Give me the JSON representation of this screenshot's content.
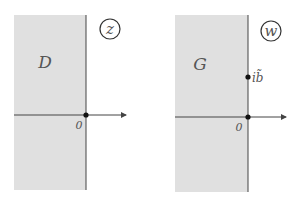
{
  "panels": [
    {
      "plane_label": "z",
      "region_label": "D",
      "origin_label": "0"
    },
    {
      "plane_label": "w",
      "region_label": "G",
      "origin_label": "0",
      "point_label": "ib̃"
    }
  ],
  "colors": {
    "region": "#e0e0e0",
    "axis": "#444444"
  }
}
